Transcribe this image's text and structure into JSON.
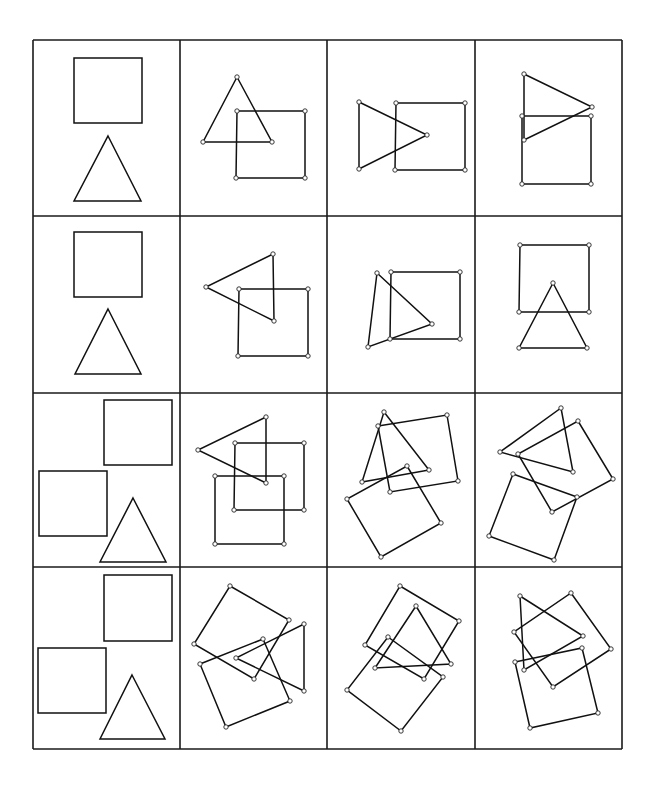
{
  "figure": {
    "title": "",
    "grid": {
      "cols": [
        33,
        180,
        327,
        475,
        622
      ],
      "rows": [
        40,
        216,
        393,
        567,
        749
      ],
      "line_color": "#1a1a1a"
    },
    "colors": {
      "stroke": "#111111",
      "vertex_fill": "#ffffff",
      "background": "#ffffff"
    },
    "cells": [
      {
        "row": 0,
        "col": 0,
        "label": "square-and-triangle-reference",
        "show_vertices": false,
        "shapes": [
          {
            "type": "square",
            "points": [
              [
                74,
                58
              ],
              [
                142,
                58
              ],
              [
                142,
                123
              ],
              [
                74,
                123
              ]
            ]
          },
          {
            "type": "triangle",
            "points": [
              [
                108,
                136
              ],
              [
                141,
                201
              ],
              [
                74,
                201
              ]
            ]
          }
        ]
      },
      {
        "row": 0,
        "col": 1,
        "label": "triangle-overlap-square",
        "show_vertices": true,
        "shapes": [
          {
            "type": "triangle",
            "points": [
              [
                237,
                77
              ],
              [
                272,
                142
              ],
              [
                203,
                142
              ]
            ]
          },
          {
            "type": "square",
            "points": [
              [
                237,
                111
              ],
              [
                305,
                111
              ],
              [
                305,
                178
              ],
              [
                236,
                178
              ]
            ]
          }
        ]
      },
      {
        "row": 0,
        "col": 2,
        "label": "right-triangle-overlap-square",
        "show_vertices": true,
        "shapes": [
          {
            "type": "triangle",
            "points": [
              [
                359,
                102
              ],
              [
                427,
                135
              ],
              [
                359,
                169
              ]
            ]
          },
          {
            "type": "square",
            "points": [
              [
                396,
                103
              ],
              [
                465,
                103
              ],
              [
                465,
                170
              ],
              [
                395,
                170
              ]
            ]
          }
        ]
      },
      {
        "row": 0,
        "col": 3,
        "label": "right-triangle-above-square",
        "show_vertices": true,
        "shapes": [
          {
            "type": "triangle",
            "points": [
              [
                524,
                74
              ],
              [
                592,
                107
              ],
              [
                524,
                140
              ]
            ]
          },
          {
            "type": "square",
            "points": [
              [
                522,
                116
              ],
              [
                591,
                116
              ],
              [
                591,
                184
              ],
              [
                522,
                184
              ]
            ]
          }
        ]
      },
      {
        "row": 1,
        "col": 0,
        "label": "square-and-triangle-reference",
        "show_vertices": false,
        "shapes": [
          {
            "type": "square",
            "points": [
              [
                74,
                232
              ],
              [
                142,
                232
              ],
              [
                142,
                297
              ],
              [
                74,
                297
              ]
            ]
          },
          {
            "type": "triangle",
            "points": [
              [
                108,
                309
              ],
              [
                141,
                374
              ],
              [
                75,
                374
              ]
            ]
          }
        ]
      },
      {
        "row": 1,
        "col": 1,
        "label": "left-triangle-overlap-square",
        "show_vertices": true,
        "shapes": [
          {
            "type": "triangle",
            "points": [
              [
                273,
                254
              ],
              [
                206,
                287
              ],
              [
                274,
                321
              ]
            ]
          },
          {
            "type": "square",
            "points": [
              [
                239,
                289
              ],
              [
                308,
                289
              ],
              [
                308,
                356
              ],
              [
                238,
                356
              ]
            ]
          }
        ]
      },
      {
        "row": 1,
        "col": 2,
        "label": "tilted-triangle-overlap-square",
        "show_vertices": true,
        "shapes": [
          {
            "type": "triangle",
            "points": [
              [
                377,
                273
              ],
              [
                432,
                324
              ],
              [
                368,
                347
              ]
            ]
          },
          {
            "type": "square",
            "points": [
              [
                391,
                272
              ],
              [
                460,
                272
              ],
              [
                460,
                339
              ],
              [
                390,
                339
              ]
            ]
          }
        ]
      },
      {
        "row": 1,
        "col": 3,
        "label": "triangle-below-square",
        "show_vertices": true,
        "shapes": [
          {
            "type": "square",
            "points": [
              [
                520,
                245
              ],
              [
                589,
                245
              ],
              [
                589,
                312
              ],
              [
                519,
                312
              ]
            ]
          },
          {
            "type": "triangle",
            "points": [
              [
                553,
                283
              ],
              [
                587,
                348
              ],
              [
                519,
                348
              ]
            ]
          }
        ]
      },
      {
        "row": 2,
        "col": 0,
        "label": "two-squares-and-triangle-reference",
        "show_vertices": false,
        "shapes": [
          {
            "type": "square",
            "points": [
              [
                104,
                400
              ],
              [
                172,
                400
              ],
              [
                172,
                465
              ],
              [
                104,
                465
              ]
            ]
          },
          {
            "type": "square",
            "points": [
              [
                39,
                471
              ],
              [
                107,
                471
              ],
              [
                107,
                536
              ],
              [
                39,
                536
              ]
            ]
          },
          {
            "type": "triangle",
            "points": [
              [
                133,
                498
              ],
              [
                166,
                562
              ],
              [
                100,
                562
              ]
            ]
          }
        ]
      },
      {
        "row": 2,
        "col": 1,
        "label": "left-triangle-two-squares",
        "show_vertices": true,
        "shapes": [
          {
            "type": "triangle",
            "points": [
              [
                266,
                417
              ],
              [
                198,
                450
              ],
              [
                266,
                483
              ]
            ]
          },
          {
            "type": "square",
            "points": [
              [
                235,
                443
              ],
              [
                304,
                443
              ],
              [
                304,
                510
              ],
              [
                234,
                510
              ]
            ]
          },
          {
            "type": "square",
            "points": [
              [
                215,
                476
              ],
              [
                284,
                476
              ],
              [
                284,
                544
              ],
              [
                215,
                544
              ]
            ]
          }
        ]
      },
      {
        "row": 2,
        "col": 2,
        "label": "rotated-triangle-two-squares",
        "show_vertices": true,
        "shapes": [
          {
            "type": "triangle",
            "points": [
              [
                384,
                412
              ],
              [
                429,
                470
              ],
              [
                362,
                482
              ]
            ]
          },
          {
            "type": "square",
            "points": [
              [
                378,
                426
              ],
              [
                447,
                415
              ],
              [
                458,
                481
              ],
              [
                390,
                492
              ]
            ]
          },
          {
            "type": "square",
            "points": [
              [
                407,
                466
              ],
              [
                441,
                523
              ],
              [
                381,
                557
              ],
              [
                347,
                499
              ]
            ]
          }
        ]
      },
      {
        "row": 2,
        "col": 3,
        "label": "rotated-triangle-two-squares",
        "show_vertices": true,
        "shapes": [
          {
            "type": "triangle",
            "points": [
              [
                561,
                408
              ],
              [
                573,
                472
              ],
              [
                500,
                452
              ]
            ]
          },
          {
            "type": "square",
            "points": [
              [
                578,
                421
              ],
              [
                613,
                479
              ],
              [
                552,
                512
              ],
              [
                518,
                454
              ]
            ]
          },
          {
            "type": "square",
            "points": [
              [
                513,
                474
              ],
              [
                577,
                497
              ],
              [
                554,
                560
              ],
              [
                489,
                536
              ]
            ]
          }
        ]
      },
      {
        "row": 3,
        "col": 0,
        "label": "two-squares-and-triangle-reference",
        "show_vertices": false,
        "shapes": [
          {
            "type": "square",
            "points": [
              [
                104,
                575
              ],
              [
                172,
                575
              ],
              [
                172,
                641
              ],
              [
                104,
                641
              ]
            ]
          },
          {
            "type": "square",
            "points": [
              [
                38,
                648
              ],
              [
                106,
                648
              ],
              [
                106,
                713
              ],
              [
                38,
                713
              ]
            ]
          },
          {
            "type": "triangle",
            "points": [
              [
                132,
                675
              ],
              [
                165,
                739
              ],
              [
                100,
                739
              ]
            ]
          }
        ]
      },
      {
        "row": 3,
        "col": 1,
        "label": "rotated-triangle-two-squares",
        "show_vertices": true,
        "shapes": [
          {
            "type": "square",
            "points": [
              [
                230,
                586
              ],
              [
                289,
                620
              ],
              [
                254,
                679
              ],
              [
                194,
                644
              ]
            ]
          },
          {
            "type": "triangle",
            "points": [
              [
                304,
                624
              ],
              [
                304,
                691
              ],
              [
                236,
                658
              ]
            ]
          },
          {
            "type": "square",
            "points": [
              [
                263,
                639
              ],
              [
                290,
                701
              ],
              [
                226,
                727
              ],
              [
                200,
                664
              ]
            ]
          }
        ]
      },
      {
        "row": 3,
        "col": 2,
        "label": "rotated-triangle-two-squares",
        "show_vertices": true,
        "shapes": [
          {
            "type": "square",
            "points": [
              [
                400,
                586
              ],
              [
                459,
                621
              ],
              [
                424,
                679
              ],
              [
                365,
                645
              ]
            ]
          },
          {
            "type": "triangle",
            "points": [
              [
                416,
                606
              ],
              [
                451,
                664
              ],
              [
                375,
                668
              ]
            ]
          },
          {
            "type": "square",
            "points": [
              [
                388,
                637
              ],
              [
                443,
                677
              ],
              [
                401,
                731
              ],
              [
                347,
                690
              ]
            ]
          }
        ]
      },
      {
        "row": 3,
        "col": 3,
        "label": "rotated-triangle-two-squares",
        "show_vertices": true,
        "shapes": [
          {
            "type": "triangle",
            "points": [
              [
                520,
                596
              ],
              [
                583,
                636
              ],
              [
                524,
                670
              ]
            ]
          },
          {
            "type": "square",
            "points": [
              [
                571,
                593
              ],
              [
                611,
                649
              ],
              [
                553,
                687
              ],
              [
                514,
                632
              ]
            ]
          },
          {
            "type": "square",
            "points": [
              [
                515,
                662
              ],
              [
                582,
                648
              ],
              [
                598,
                713
              ],
              [
                530,
                728
              ]
            ]
          }
        ]
      }
    ]
  }
}
